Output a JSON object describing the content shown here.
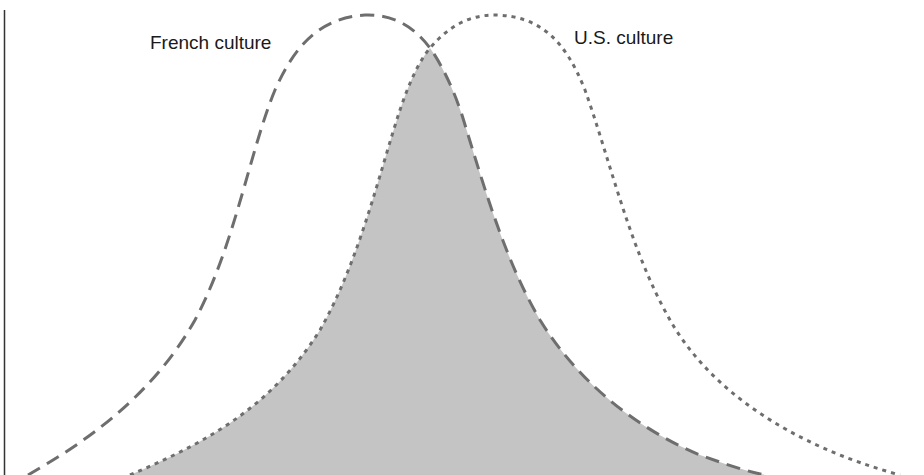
{
  "diagram": {
    "title": "",
    "type": "overlapping-distributions",
    "labels": {
      "french": "French culture",
      "us": "U.S. culture"
    },
    "colors": {
      "background": "#ffffff",
      "curve_stroke": "#6e6e6e",
      "overlap_fill": "#c4c4c4",
      "axis": "#333333",
      "text": "#1a1a1a"
    },
    "series": [
      {
        "name": "French culture",
        "line_style": "long-dash",
        "peak": {
          "x": 365,
          "y": 15
        }
      },
      {
        "name": "U.S. culture",
        "line_style": "short-dash",
        "peak": {
          "x": 495,
          "y": 15
        }
      }
    ],
    "overlap": {
      "description": "shaded region shared by both cultures",
      "apex": {
        "x": 430,
        "y": 48
      }
    }
  }
}
